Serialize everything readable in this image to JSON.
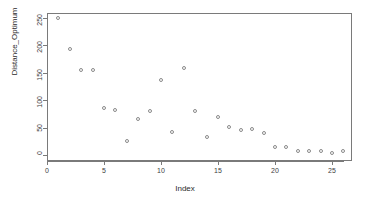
{
  "chart_data": {
    "type": "scatter",
    "title": "",
    "xlabel": "Index",
    "ylabel": "Distance_Optimum",
    "xlim": [
      0,
      27
    ],
    "ylim": [
      0,
      258
    ],
    "grid": false,
    "legend": null,
    "x_ticks": [
      0,
      5,
      10,
      15,
      20,
      25
    ],
    "x_tick_labels": [
      "0",
      "5",
      "10",
      "15",
      "20",
      "25"
    ],
    "y_ticks": [
      0,
      50,
      100,
      150,
      200,
      250
    ],
    "y_tick_labels": [
      "0",
      "50",
      "100",
      "150",
      "200",
      "250"
    ],
    "marker": "open-circle",
    "marker_color": "#8a8a8a",
    "x": [
      1,
      2,
      3,
      4,
      5,
      6,
      7,
      8,
      9,
      10,
      11,
      12,
      13,
      14,
      15,
      16,
      17,
      18,
      19,
      20,
      21,
      22,
      23,
      24,
      25,
      26
    ],
    "y": [
      250,
      193,
      155,
      155,
      85,
      82,
      25,
      66,
      80,
      137,
      42,
      159,
      81,
      32,
      69,
      51,
      45,
      47,
      41,
      14,
      15,
      7,
      8,
      7,
      3,
      7
    ]
  },
  "axes": {
    "x_title": "Index",
    "y_title": "Distance_Optimum"
  }
}
